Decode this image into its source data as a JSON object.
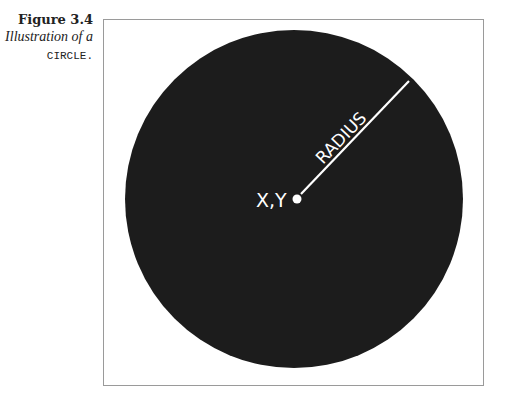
{
  "caption": {
    "figure_label": "Figure 3.4",
    "description_prefix": "Illustration of a",
    "code_word": "CIRCLE",
    "period": "."
  },
  "illustration": {
    "center_label": "X,Y",
    "radius_label": "RADIUS",
    "fill_color": "#1c1c1c",
    "line_color": "#ffffff",
    "frame_color": "#9a9a9a"
  }
}
